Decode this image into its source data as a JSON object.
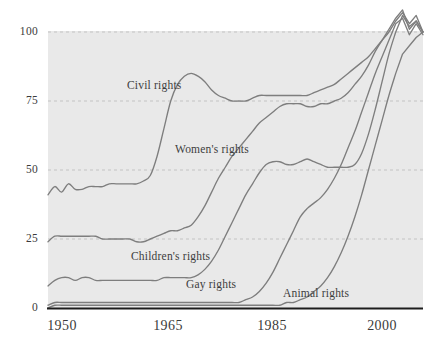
{
  "chart_data": {
    "type": "line",
    "title": "",
    "subtitle": "",
    "xlabel": "",
    "ylabel": "",
    "xlim": [
      1950,
      2005
    ],
    "ylim": [
      0,
      110
    ],
    "grid": "horizontal-dashed",
    "legend": "inline-annotations",
    "colors": {
      "line": "#7e7e7e",
      "plot_background": "#e9e9e9",
      "axis": "#1d1d1d",
      "gridline": "#b9b9b9",
      "text": "#3b3b3b"
    },
    "y_ticks": [
      {
        "value": 0,
        "label": "0"
      },
      {
        "value": 25,
        "label": "25"
      },
      {
        "value": 50,
        "label": "50"
      },
      {
        "value": 75,
        "label": "75"
      },
      {
        "value": 100,
        "label": "100"
      }
    ],
    "x_ticks": [
      {
        "value": 1950,
        "label": "1950"
      },
      {
        "value": 1965,
        "label": "1965"
      },
      {
        "value": 1985,
        "label": "1985"
      },
      {
        "value": 2000,
        "label": "2000"
      }
    ],
    "x": [
      1950,
      1951,
      1952,
      1953,
      1954,
      1955,
      1956,
      1957,
      1958,
      1959,
      1960,
      1961,
      1962,
      1963,
      1964,
      1965,
      1966,
      1967,
      1968,
      1969,
      1970,
      1971,
      1972,
      1973,
      1974,
      1975,
      1976,
      1977,
      1978,
      1979,
      1980,
      1981,
      1982,
      1983,
      1984,
      1985,
      1986,
      1987,
      1988,
      1989,
      1990,
      1991,
      1992,
      1993,
      1994,
      1995,
      1996,
      1997,
      1998,
      1999,
      2000,
      2001,
      2002,
      2003,
      2004,
      2005
    ],
    "series": [
      {
        "name": "Civil rights",
        "label": "Civil rights",
        "color": "#7e7e7e",
        "label_x": 1957.5,
        "label_y": 80.5,
        "values": [
          41,
          44,
          42,
          45,
          43,
          43,
          44,
          44,
          44,
          45,
          45,
          45,
          45,
          45,
          46,
          48,
          55,
          65,
          75,
          81,
          84,
          85,
          84,
          82,
          79,
          77,
          76,
          75,
          75,
          75,
          76,
          77,
          77,
          77,
          77,
          77,
          77,
          77,
          77,
          78,
          79,
          80,
          81,
          83,
          85,
          87,
          89,
          91,
          94,
          97,
          100,
          104,
          107,
          103,
          106,
          100
        ]
      },
      {
        "name": "Women's rights",
        "label": "Women's rights",
        "color": "#7e7e7e",
        "label_x": 1968.5,
        "label_y": 57.5,
        "values": [
          24,
          26,
          26,
          26,
          26,
          26,
          26,
          26,
          25,
          25,
          25,
          25,
          25,
          24,
          24,
          25,
          26,
          27,
          28,
          28,
          29,
          30,
          33,
          37,
          42,
          47,
          51,
          55,
          58,
          61,
          64,
          67,
          69,
          71,
          73,
          74,
          74,
          74,
          73,
          73,
          74,
          74,
          75,
          76,
          78,
          81,
          84,
          88,
          93,
          97,
          101,
          105,
          108,
          101,
          104,
          100
        ]
      },
      {
        "name": "Children's rights",
        "label": "Children's rights",
        "color": "#7e7e7e",
        "label_x": 1960.5,
        "label_y": 19.0,
        "values": [
          8,
          10,
          11,
          11,
          10,
          11,
          11,
          10,
          10,
          10,
          10,
          10,
          10,
          10,
          10,
          10,
          10,
          11,
          11,
          11,
          11,
          11,
          12,
          14,
          17,
          21,
          26,
          31,
          36,
          41,
          45,
          49,
          52,
          53,
          53,
          52,
          52,
          53,
          54,
          53,
          52,
          51,
          51,
          51,
          51,
          52,
          56,
          63,
          72,
          82,
          92,
          100,
          106,
          102,
          104,
          100
        ]
      },
      {
        "name": "Gay rights",
        "label": "Gay rights",
        "color": "#7e7e7e",
        "label_x": 1977.0,
        "label_y": 8.0,
        "values": [
          1,
          2,
          2,
          2,
          2,
          2,
          2,
          2,
          2,
          2,
          2,
          2,
          2,
          2,
          2,
          2,
          2,
          2,
          2,
          2,
          2,
          2,
          2,
          2,
          2,
          2,
          2,
          2,
          2,
          3,
          4,
          6,
          9,
          13,
          18,
          23,
          28,
          33,
          36,
          38,
          40,
          43,
          47,
          52,
          58,
          64,
          71,
          78,
          85,
          91,
          97,
          103,
          105,
          99,
          103,
          99
        ]
      },
      {
        "name": "Animal rights",
        "label": "Animal rights",
        "color": "#7e7e7e",
        "label_x": 1989.0,
        "label_y": 5.5,
        "values": [
          0,
          1,
          1,
          1,
          1,
          1,
          1,
          1,
          1,
          1,
          1,
          1,
          1,
          1,
          1,
          1,
          1,
          1,
          1,
          1,
          1,
          1,
          1,
          1,
          1,
          1,
          1,
          1,
          1,
          1,
          1,
          1,
          1,
          1,
          1,
          2,
          2,
          3,
          4,
          6,
          8,
          11,
          15,
          20,
          26,
          33,
          41,
          50,
          59,
          68,
          77,
          85,
          92,
          95,
          98,
          100
        ]
      }
    ]
  }
}
